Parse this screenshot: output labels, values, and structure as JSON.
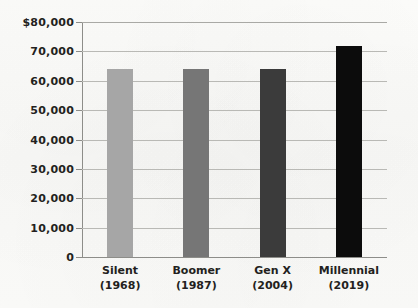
{
  "chart_data": {
    "type": "bar",
    "title": "",
    "xlabel": "",
    "ylabel": "",
    "categories": [
      "Silent",
      "Boomer",
      "Gen X",
      "Millennial"
    ],
    "category_sublabels": [
      "(1968)",
      "(1987)",
      "(2004)",
      "(2019)"
    ],
    "values": [
      64000,
      64000,
      64000,
      72000
    ],
    "ylim": [
      0,
      80000
    ],
    "ytick_values": [
      0,
      10000,
      20000,
      30000,
      40000,
      50000,
      60000,
      70000,
      80000
    ],
    "ytick_labels": [
      "0",
      "10,000",
      "20,000",
      "30,000",
      "40,000",
      "50,000",
      "60,000",
      "70,000",
      "$80,000"
    ],
    "grid": true,
    "legend": "none",
    "bar_colors": [
      "#a6a6a6",
      "#767676",
      "#3b3b3b",
      "#0c0c0c"
    ],
    "gridline_color": "#b9b9b5",
    "axis_color": "#8d8d89",
    "text_color": "#231f20",
    "background_color": "#fbfbf9"
  }
}
